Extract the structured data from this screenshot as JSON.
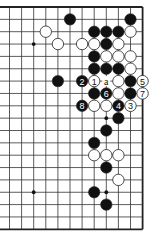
{
  "diagram": {
    "type": "go-board-fragment",
    "grid": {
      "columns": 12,
      "rows": 19,
      "origin_x": 9.5,
      "origin_y": 7,
      "spacing_x": 12.1,
      "spacing_y": 12.35,
      "edges": {
        "top": true,
        "right": true,
        "bottom": true,
        "left": false
      }
    },
    "colors": {
      "line": "#333333",
      "edge": "#222222",
      "black_stone": "#111111",
      "white_stone": "#ffffff",
      "stone_outline": "#222222",
      "background": "#ffffff"
    },
    "star_points": [
      {
        "c": 2,
        "r": 3
      },
      {
        "c": 8,
        "r": 9
      },
      {
        "c": 2,
        "r": 15
      },
      {
        "c": 8,
        "r": 15
      }
    ],
    "stones": [
      {
        "c": 5,
        "r": 1,
        "color": "black"
      },
      {
        "c": 10,
        "r": 1,
        "color": "black"
      },
      {
        "c": 3,
        "r": 2,
        "color": "white"
      },
      {
        "c": 7,
        "r": 2,
        "color": "black"
      },
      {
        "c": 8,
        "r": 2,
        "color": "black"
      },
      {
        "c": 9,
        "r": 2,
        "color": "black"
      },
      {
        "c": 10,
        "r": 2,
        "color": "white"
      },
      {
        "c": 4,
        "r": 3,
        "color": "white"
      },
      {
        "c": 6,
        "r": 3,
        "color": "white"
      },
      {
        "c": 7,
        "r": 3,
        "color": "white"
      },
      {
        "c": 8,
        "r": 3,
        "color": "black"
      },
      {
        "c": 9,
        "r": 3,
        "color": "white"
      },
      {
        "c": 7,
        "r": 4,
        "color": "black"
      },
      {
        "c": 8,
        "r": 4,
        "color": "white"
      },
      {
        "c": 9,
        "r": 4,
        "color": "white"
      },
      {
        "c": 10,
        "r": 4,
        "color": "white"
      },
      {
        "c": 7,
        "r": 5,
        "color": "black"
      },
      {
        "c": 8,
        "r": 5,
        "color": "black"
      },
      {
        "c": 9,
        "r": 5,
        "color": "black"
      },
      {
        "c": 10,
        "r": 5,
        "color": "white"
      },
      {
        "c": 4,
        "r": 6,
        "color": "black"
      },
      {
        "c": 6,
        "r": 6,
        "color": "black",
        "label": "2"
      },
      {
        "c": 7,
        "r": 6,
        "color": "white",
        "label": "1"
      },
      {
        "c": 9,
        "r": 6,
        "color": "white"
      },
      {
        "c": 10,
        "r": 6,
        "color": "black"
      },
      {
        "c": 11,
        "r": 6,
        "color": "white",
        "label": "5"
      },
      {
        "c": 7,
        "r": 7,
        "color": "black"
      },
      {
        "c": 8,
        "r": 7,
        "color": "black",
        "label": "6"
      },
      {
        "c": 9,
        "r": 7,
        "color": "white"
      },
      {
        "c": 10,
        "r": 7,
        "color": "black"
      },
      {
        "c": 11,
        "r": 7,
        "color": "white",
        "label": "7"
      },
      {
        "c": 6,
        "r": 8,
        "color": "black",
        "label": "8"
      },
      {
        "c": 7,
        "r": 8,
        "color": "white"
      },
      {
        "c": 8,
        "r": 8,
        "color": "white"
      },
      {
        "c": 9,
        "r": 8,
        "color": "black",
        "label": "4"
      },
      {
        "c": 10,
        "r": 8,
        "color": "white",
        "label": "3"
      },
      {
        "c": 9,
        "r": 9,
        "color": "black"
      },
      {
        "c": 8,
        "r": 10,
        "color": "black"
      },
      {
        "c": 7,
        "r": 11,
        "color": "black"
      },
      {
        "c": 7,
        "r": 12,
        "color": "white"
      },
      {
        "c": 8,
        "r": 12,
        "color": "white"
      },
      {
        "c": 9,
        "r": 12,
        "color": "white"
      },
      {
        "c": 8,
        "r": 13,
        "color": "black"
      },
      {
        "c": 9,
        "r": 14,
        "color": "white"
      },
      {
        "c": 7,
        "r": 15,
        "color": "black"
      },
      {
        "c": 8,
        "r": 16,
        "color": "black"
      }
    ],
    "point_labels": [
      {
        "c": 8,
        "r": 6,
        "text": "a"
      }
    ]
  }
}
